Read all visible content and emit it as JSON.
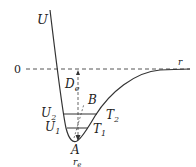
{
  "diagram": {
    "type": "potential-energy-curve",
    "labels": {
      "y_axis": "U",
      "x_axis": "r",
      "zero": "0",
      "dissociation": "D",
      "dissociation_sub": "e",
      "minimum": "A",
      "point_b": "B",
      "level_u2": "U",
      "level_u2_sub": "2",
      "level_u1": "U",
      "level_u1_sub": "1",
      "turning_t2": "T",
      "turning_t2_sub": "2",
      "turning_t1": "T",
      "turning_t1_sub": "1",
      "equilibrium": "r",
      "equilibrium_sub": "e"
    },
    "colors": {
      "curve": "#333333",
      "dashed": "#555555",
      "text": "#222222"
    }
  }
}
